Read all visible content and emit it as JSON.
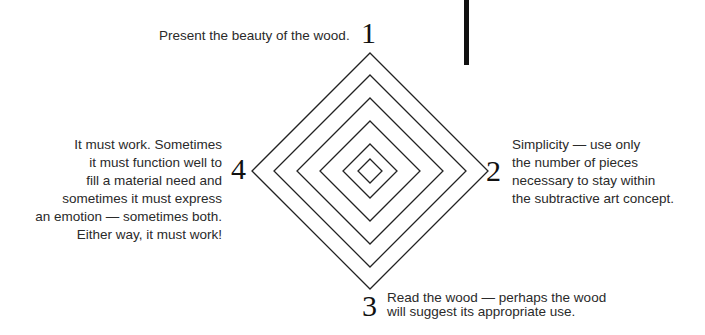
{
  "diagram": {
    "type": "concentric-diamond",
    "center": {
      "x": 370,
      "y": 171
    },
    "ring_half_sizes": [
      118,
      96,
      73,
      50,
      27,
      12
    ],
    "stroke_color": "#222222",
    "corners": [
      {
        "number": "1",
        "position": "top",
        "lines": [
          "Present the beauty of the wood."
        ]
      },
      {
        "number": "2",
        "position": "right",
        "lines": [
          "Simplicity — use only",
          "the number of pieces",
          "necessary to stay within",
          "the subtractive art concept."
        ]
      },
      {
        "number": "3",
        "position": "bottom",
        "lines": [
          "Read the wood — perhaps the wood",
          "will suggest its appropriate use."
        ]
      },
      {
        "number": "4",
        "position": "left",
        "lines": [
          "It must work. Sometimes",
          "it must function well to",
          "fill a material need and",
          "sometimes it must express",
          "an emotion — sometimes both.",
          "Either way, it must work!"
        ]
      }
    ]
  }
}
